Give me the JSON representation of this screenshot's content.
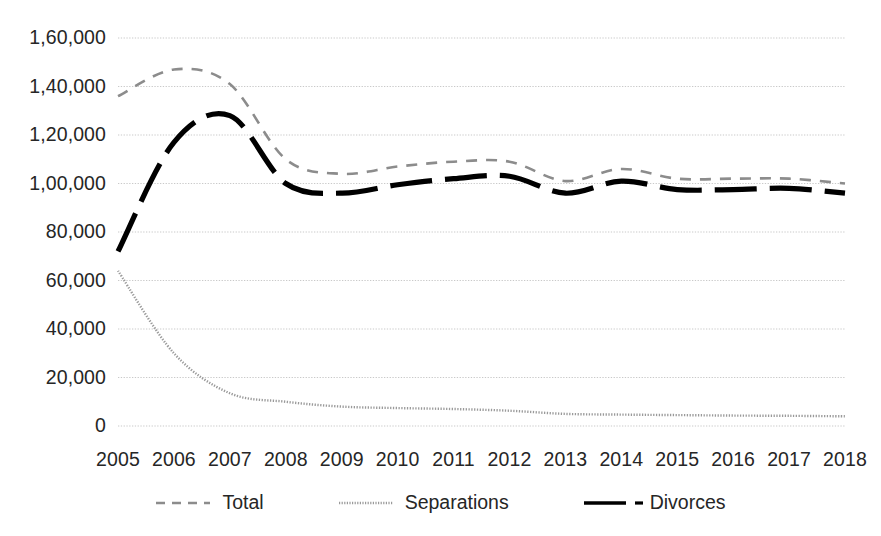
{
  "chart_data": {
    "type": "line",
    "title": "",
    "subtitle": "",
    "xlabel": "",
    "ylabel": "",
    "x": [
      2005,
      2006,
      2007,
      2008,
      2009,
      2010,
      2011,
      2012,
      2013,
      2014,
      2015,
      2016,
      2017,
      2018
    ],
    "categories": [
      "2005",
      "2006",
      "2007",
      "2008",
      "2009",
      "2010",
      "2011",
      "2012",
      "2013",
      "2014",
      "2015",
      "2016",
      "2017",
      "2018"
    ],
    "series": [
      {
        "name": "Total",
        "style": "dashed",
        "color": "#8c8c8c",
        "values": [
          136000,
          147000,
          141000,
          110000,
          104000,
          107000,
          109000,
          109000,
          101000,
          106000,
          102000,
          102000,
          102000,
          100000
        ]
      },
      {
        "name": "Separations",
        "style": "dotted",
        "color": "#9a9a9a",
        "values": [
          64000,
          30000,
          13500,
          10000,
          8000,
          7400,
          7000,
          6300,
          5000,
          4700,
          4500,
          4300,
          4200,
          4000
        ]
      },
      {
        "name": "Divorces",
        "style": "bold-dashed",
        "color": "#000000",
        "values": [
          72000,
          117000,
          128000,
          100000,
          96000,
          99500,
          102000,
          103000,
          96000,
          101000,
          97500,
          97500,
          98000,
          96000
        ]
      }
    ],
    "ylim": [
      0,
      160000
    ],
    "xlim": [
      2005,
      2018
    ],
    "yticks": [
      0,
      20000,
      40000,
      60000,
      80000,
      100000,
      120000,
      140000,
      160000
    ],
    "ytick_labels": [
      "0",
      "20,000",
      "40,000",
      "60,000",
      "80,000",
      "1,00,000",
      "1,20,000",
      "1,40,000",
      "1,60,000"
    ],
    "xtick_labels": [
      "2005",
      "2006",
      "2007",
      "2008",
      "2009",
      "2010",
      "2011",
      "2012",
      "2013",
      "2014",
      "2015",
      "2016",
      "2017",
      "2018"
    ],
    "grid": true,
    "grid_axis": "y",
    "grid_color": "#c9c9c9",
    "legend_position": "bottom",
    "legend_entries": [
      "Total",
      "Separations",
      "Divorces"
    ],
    "background": "#ffffff"
  },
  "legend": {
    "items": [
      {
        "label": "Total",
        "icon": "dashed-line-icon"
      },
      {
        "label": "Separations",
        "icon": "dotted-line-icon"
      },
      {
        "label": "Divorces",
        "icon": "bold-dashed-line-icon"
      }
    ]
  }
}
